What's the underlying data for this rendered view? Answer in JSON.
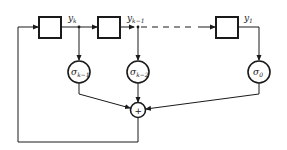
{
  "diagram": {
    "type": "shift-register feedback structure",
    "delays": [
      {
        "id": "delay-1",
        "output_label": "y",
        "output_sub": "k"
      },
      {
        "id": "delay-2",
        "output_label": "y",
        "output_sub": "k−1"
      },
      {
        "id": "delay-3",
        "output_label": "y",
        "output_sub": "1"
      }
    ],
    "coefficients": [
      {
        "id": "coef-1",
        "label": "σ",
        "sub": "k−1"
      },
      {
        "id": "coef-2",
        "label": "σ",
        "sub": "k−2"
      },
      {
        "id": "coef-3",
        "label": "σ",
        "sub": "0"
      }
    ],
    "adder": {
      "symbol": "+"
    },
    "colors": {
      "stroke": "#1a1a1a",
      "background": "#ffffff"
    }
  }
}
